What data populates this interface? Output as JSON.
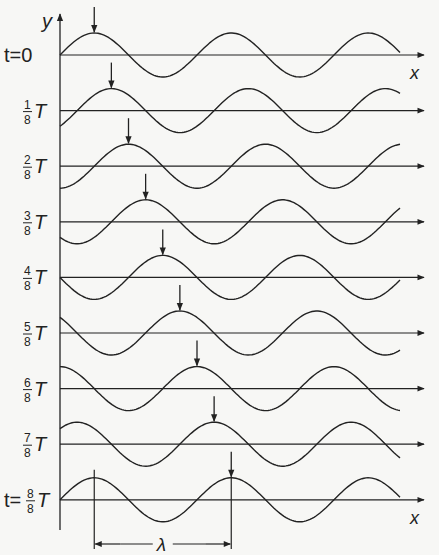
{
  "diagram": {
    "y_axis_label": "y",
    "x_axis_label": "x",
    "wavelength_label": "λ",
    "rows": [
      {
        "prefix": "t = ",
        "num": "",
        "den": "",
        "text": "0",
        "phase": 0
      },
      {
        "prefix": "",
        "num": "1",
        "den": "8",
        "text": "T",
        "phase": 1
      },
      {
        "prefix": "",
        "num": "2",
        "den": "8",
        "text": "T",
        "phase": 2
      },
      {
        "prefix": "",
        "num": "3",
        "den": "8",
        "text": "T",
        "phase": 3
      },
      {
        "prefix": "",
        "num": "4",
        "den": "8",
        "text": "T",
        "phase": 4
      },
      {
        "prefix": "",
        "num": "5",
        "den": "8",
        "text": "T",
        "phase": 5
      },
      {
        "prefix": "",
        "num": "6",
        "den": "8",
        "text": "T",
        "phase": 6
      },
      {
        "prefix": "",
        "num": "7",
        "den": "8",
        "text": "T",
        "phase": 7
      },
      {
        "prefix": "t = ",
        "num": "8",
        "den": "8",
        "text": "T",
        "phase": 8
      }
    ],
    "colors": {
      "ink": "#222222",
      "background": "#f7f7f5"
    }
  }
}
